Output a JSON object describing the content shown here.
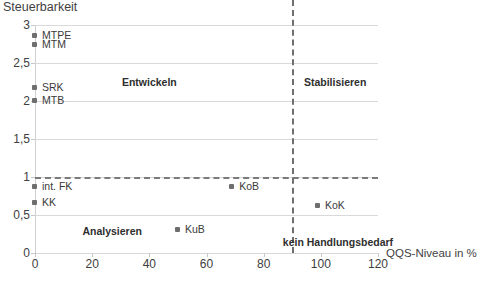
{
  "chart_data": {
    "type": "scatter",
    "title": "",
    "ylabel": "Steuerbarkeit",
    "xlabel": "QQS-Niveau in %",
    "xlim": [
      0,
      120
    ],
    "ylim": [
      0,
      3
    ],
    "xticks": [
      0,
      20,
      40,
      60,
      80,
      100,
      120
    ],
    "xticklabels": [
      "0",
      "20",
      "40",
      "60",
      "80",
      "100",
      "120"
    ],
    "yticks": [
      0,
      0.5,
      1,
      1.5,
      2,
      2.5,
      3
    ],
    "yticklabels": [
      "0",
      "0,5",
      "1",
      "1,5",
      "2",
      "2,5",
      "3"
    ],
    "grid": true,
    "legend": "none",
    "points": [
      {
        "label": "MTPE",
        "x": 0,
        "y": 2.85
      },
      {
        "label": "MTM",
        "x": 0,
        "y": 2.74
      },
      {
        "label": "SRK",
        "x": 0,
        "y": 2.17
      },
      {
        "label": "MTB",
        "x": 0,
        "y": 2.0
      },
      {
        "label": "int. FK",
        "x": 0,
        "y": 0.87
      },
      {
        "label": "KK",
        "x": 0,
        "y": 0.66
      },
      {
        "label": "KoB",
        "x": 69,
        "y": 0.87
      },
      {
        "label": "KoK",
        "x": 99,
        "y": 0.62
      },
      {
        "label": "KuB",
        "x": 50,
        "y": 0.3
      }
    ],
    "thresholds": {
      "vertical_x": 90,
      "horizontal_y": 1
    },
    "quadrant_labels": [
      {
        "text": "Entwickeln",
        "x": 40,
        "y": 2.25
      },
      {
        "text": "Stabilisieren",
        "x": 105,
        "y": 2.25
      },
      {
        "text": "Analysieren",
        "x": 27,
        "y": 0.29
      },
      {
        "text": "kein Handlungsbedarf",
        "x": 106,
        "y": 0.14
      }
    ],
    "colors": {
      "marker": "#6e6e6e",
      "gridline": "#d9d9d9",
      "threshold": "#7a7a7a",
      "text": "#3a3a3a",
      "background": "#ffffff"
    }
  }
}
